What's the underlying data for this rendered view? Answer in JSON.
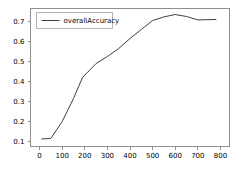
{
  "chart_data": {
    "type": "line",
    "title": "",
    "xlabel": "",
    "ylabel": "",
    "xlim": [
      -40,
      840
    ],
    "ylim": [
      0.075,
      0.765
    ],
    "grid": false,
    "legend_position": "upper left",
    "xticks": [
      0,
      100,
      200,
      300,
      400,
      500,
      600,
      700,
      800
    ],
    "xtick_labels": [
      "0",
      "100",
      "200",
      "300",
      "400",
      "500",
      "600",
      "700",
      "800"
    ],
    "yticks": [
      0.1,
      0.2,
      0.3,
      0.4,
      0.5,
      0.6,
      0.7
    ],
    "ytick_labels": [
      "0.1",
      "0.2",
      "0.3",
      "0.4",
      "0.5",
      "0.6",
      "0.7"
    ],
    "series": [
      {
        "name": "overallAccuracy",
        "color": "#3f3f3f",
        "x": [
          10,
          50,
          100,
          150,
          190,
          250,
          300,
          350,
          400,
          450,
          500,
          550,
          600,
          650,
          700,
          740,
          780
        ],
        "values": [
          0.113,
          0.115,
          0.2,
          0.315,
          0.42,
          0.49,
          0.525,
          0.565,
          0.615,
          0.66,
          0.705,
          0.723,
          0.735,
          0.725,
          0.708,
          0.709,
          0.71
        ]
      }
    ]
  },
  "legend": {
    "entries": [
      {
        "label": "overallAccuracy"
      }
    ]
  },
  "axes": {
    "x_axis_name": "x-axis",
    "y_axis_name": "y-axis"
  }
}
